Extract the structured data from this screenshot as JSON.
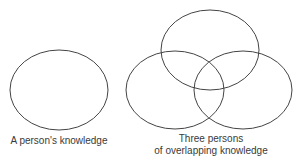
{
  "diagram": {
    "stroke_color": "#444444",
    "single": {
      "label": "A person's knowledge",
      "ellipse": {
        "cx": 59,
        "cy": 90,
        "rx": 49,
        "ry": 40
      }
    },
    "triple": {
      "label_line1": "Three persons",
      "label_line2": "of overlapping knowledge",
      "ellipses": [
        {
          "name": "top",
          "cx": 210,
          "cy": 50,
          "rx": 49,
          "ry": 40
        },
        {
          "name": "bottom-left",
          "cx": 175,
          "cy": 90,
          "rx": 49,
          "ry": 39
        },
        {
          "name": "bottom-right",
          "cx": 243,
          "cy": 90,
          "rx": 49,
          "ry": 39
        }
      ]
    }
  }
}
